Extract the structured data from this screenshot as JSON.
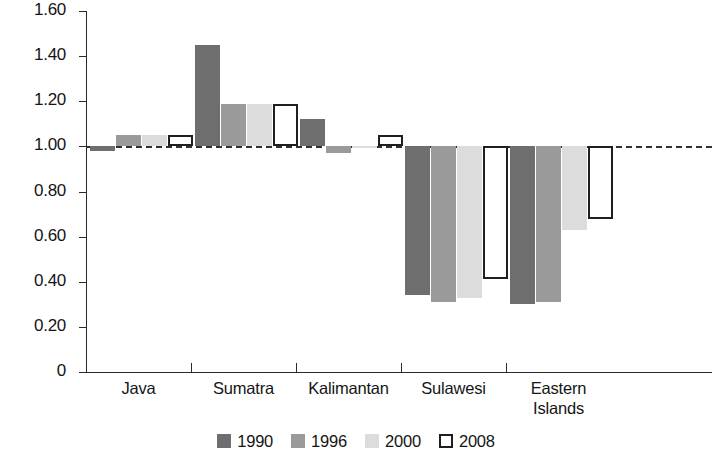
{
  "chart_data": {
    "type": "bar",
    "title": "",
    "subtitle": "",
    "xlabel": "",
    "ylabel": "GDP relative to average",
    "categories": [
      "Java",
      "Sumatra",
      "Kalimantan",
      "Sulawesi",
      "Eastern Islands"
    ],
    "category_lines": [
      [
        "Java"
      ],
      [
        "Sumatra"
      ],
      [
        "Kalimantan"
      ],
      [
        "Sulawesi"
      ],
      [
        "Eastern",
        "Islands"
      ]
    ],
    "series": [
      {
        "name": "1990",
        "color": "#6e6e6e",
        "values": [
          0.98,
          1.45,
          1.12,
          0.34,
          0.3
        ]
      },
      {
        "name": "1996",
        "color": "#9a9a9a",
        "values": [
          1.05,
          1.19,
          0.97,
          0.31,
          0.31
        ]
      },
      {
        "name": "2000",
        "color": "#dcdcdc",
        "values": [
          1.05,
          1.19,
          1.0,
          0.33,
          0.63
        ]
      },
      {
        "name": "2008",
        "color": "#ffffff",
        "values": [
          1.05,
          1.19,
          1.05,
          0.41,
          0.68
        ]
      }
    ],
    "baseline": 1.0,
    "ylim": [
      0,
      1.6
    ],
    "yticks": [
      0,
      0.2,
      0.4,
      0.6,
      0.8,
      1.0,
      1.2,
      1.4,
      1.6
    ],
    "ytick_labels": [
      "0",
      "0.20",
      "0.40",
      "0.60",
      "0.80",
      "1.00",
      "1.20",
      "1.40",
      "1.60"
    ],
    "grid": false,
    "legend_position": "bottom",
    "legend_entries": [
      "1990",
      "1996",
      "2000",
      "2008"
    ]
  }
}
